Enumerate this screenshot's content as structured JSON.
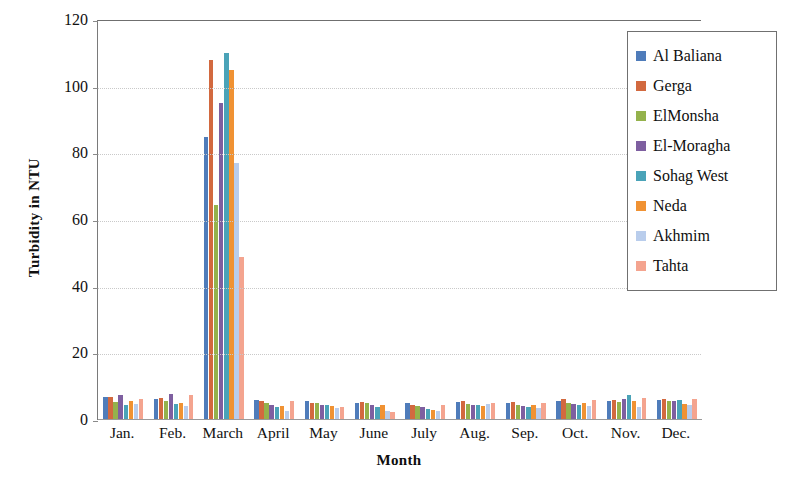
{
  "chart_data": {
    "type": "bar",
    "title": "",
    "xlabel": "Month",
    "ylabel": "Turbidity in NTU",
    "ylim": [
      0,
      120
    ],
    "yticks": [
      0,
      20,
      40,
      60,
      80,
      100,
      120
    ],
    "grid": true,
    "legend_position": "right",
    "categories": [
      "Jan.",
      "Feb.",
      "March",
      "April",
      "May",
      "June",
      "July",
      "Aug.",
      "Sep.",
      "Oct.",
      "Nov.",
      "Dec."
    ],
    "series": [
      {
        "name": "Al Baliana",
        "color": "#4f7cba",
        "values": [
          6.8,
          6.2,
          85.0,
          6.0,
          5.6,
          5.2,
          5.0,
          5.4,
          5.2,
          5.8,
          5.8,
          6.0
        ]
      },
      {
        "name": "Gerga",
        "color": "#d2693f",
        "values": [
          7.0,
          6.5,
          108.0,
          5.8,
          5.2,
          5.4,
          4.6,
          5.8,
          5.4,
          6.2,
          6.0,
          6.4
        ]
      },
      {
        "name": "ElMonsha",
        "color": "#94b24c",
        "values": [
          5.4,
          5.6,
          64.5,
          5.0,
          5.0,
          5.0,
          4.2,
          4.8,
          4.4,
          5.2,
          5.4,
          5.6
        ]
      },
      {
        "name": "El-Moragha",
        "color": "#7e5fa0",
        "values": [
          7.6,
          7.8,
          95.0,
          4.4,
          4.6,
          4.4,
          3.8,
          4.6,
          4.2,
          4.8,
          6.2,
          5.8
        ]
      },
      {
        "name": "Sohag West",
        "color": "#4aa3b8",
        "values": [
          4.6,
          4.8,
          110.0,
          4.0,
          4.4,
          4.0,
          3.4,
          4.4,
          4.0,
          4.6,
          7.6,
          6.0
        ]
      },
      {
        "name": "Neda",
        "color": "#f09233",
        "values": [
          5.8,
          5.0,
          105.0,
          4.2,
          4.2,
          4.6,
          3.0,
          4.2,
          4.6,
          5.0,
          5.6,
          4.8
        ]
      },
      {
        "name": "Akhmim",
        "color": "#b9cdec",
        "values": [
          4.8,
          4.2,
          77.0,
          2.8,
          3.6,
          2.6,
          2.6,
          4.8,
          3.6,
          4.2,
          4.0,
          4.4
        ]
      },
      {
        "name": "Tahta",
        "color": "#f4a48f",
        "values": [
          6.2,
          7.4,
          49.0,
          5.6,
          4.0,
          2.4,
          4.4,
          5.0,
          5.0,
          6.0,
          6.6,
          6.2
        ]
      }
    ]
  }
}
